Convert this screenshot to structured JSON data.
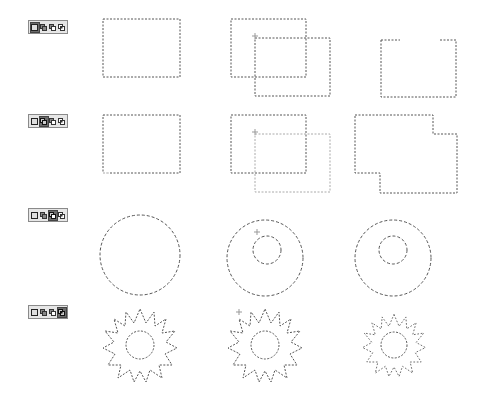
{
  "rows": [
    {
      "mode": "new-selection",
      "active_button": 0,
      "top": 20
    },
    {
      "mode": "add-to-selection",
      "active_button": 1,
      "top": 114
    },
    {
      "mode": "subtract-from-selection",
      "active_button": 2,
      "top": 208
    },
    {
      "mode": "intersect-with-selection",
      "active_button": 3,
      "top": 305
    }
  ],
  "toolbar_buttons": [
    "new-selection-icon",
    "add-selection-icon",
    "subtract-selection-icon",
    "intersect-selection-icon"
  ],
  "colors": {
    "marching_ants": "#555555",
    "toolbar_bg": "#e6e6e6",
    "toolbar_border": "#8a8a8a",
    "active_button": "#6b6b6b"
  }
}
